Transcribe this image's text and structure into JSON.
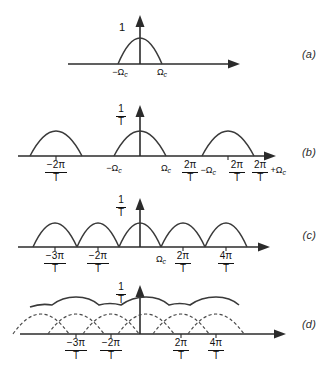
{
  "figure": {
    "background": "#ffffff",
    "curve_color": "#3a3a3a",
    "axis_color": "#2b2b2b"
  },
  "panels": [
    {
      "id": "a",
      "label": "(a)",
      "amplitude_label": {
        "type": "plain",
        "text": "1"
      },
      "description": "single baseband hump centered at origin",
      "ticks": [
        {
          "text": "−Ω",
          "sub": "c",
          "type": "plain"
        },
        {
          "text": "Ω",
          "sub": "c",
          "type": "plain"
        }
      ]
    },
    {
      "id": "b",
      "label": "(b)",
      "amplitude_label": {
        "type": "fraction",
        "num": "1",
        "den": "T"
      },
      "description": "three separated replicas, no aliasing",
      "ticks": [
        {
          "type": "fraction",
          "num": "−2π",
          "den": "T"
        },
        {
          "type": "plain",
          "text": "−Ω",
          "sub": "c"
        },
        {
          "type": "plain",
          "text": "Ω",
          "sub": "c"
        },
        {
          "type": "fraction-suffix",
          "num": "2π",
          "den": "T",
          "suffix": "−Ω",
          "suffix_sub": "c"
        },
        {
          "type": "fraction",
          "num": "2π",
          "den": "T"
        },
        {
          "type": "fraction-suffix",
          "num": "2π",
          "den": "T",
          "suffix": "+Ω",
          "suffix_sub": "c"
        }
      ]
    },
    {
      "id": "c",
      "label": "(c)",
      "amplitude_label": {
        "type": "fraction",
        "num": "1",
        "den": "T"
      },
      "description": "five replicas just touching at critical sampling",
      "ticks": [
        {
          "type": "fraction",
          "num": "−3π",
          "den": "T"
        },
        {
          "type": "fraction",
          "num": "−2π",
          "den": "T"
        },
        {
          "type": "plain",
          "text": "Ω",
          "sub": "c"
        },
        {
          "type": "fraction",
          "num": "2π",
          "den": "T"
        },
        {
          "type": "fraction",
          "num": "4π",
          "den": "T"
        }
      ]
    },
    {
      "id": "d",
      "label": "(d)",
      "amplitude_label": {
        "type": "fraction",
        "num": "1",
        "den": "T"
      },
      "description": "overlapping dashed replicas with solid aliased envelope",
      "ticks": [
        {
          "type": "fraction",
          "num": "−3π",
          "den": "T"
        },
        {
          "type": "fraction",
          "num": "−2π",
          "den": "T"
        },
        {
          "type": "fraction",
          "num": "2π",
          "den": "T"
        },
        {
          "type": "fraction",
          "num": "4π",
          "den": "T"
        }
      ]
    }
  ]
}
